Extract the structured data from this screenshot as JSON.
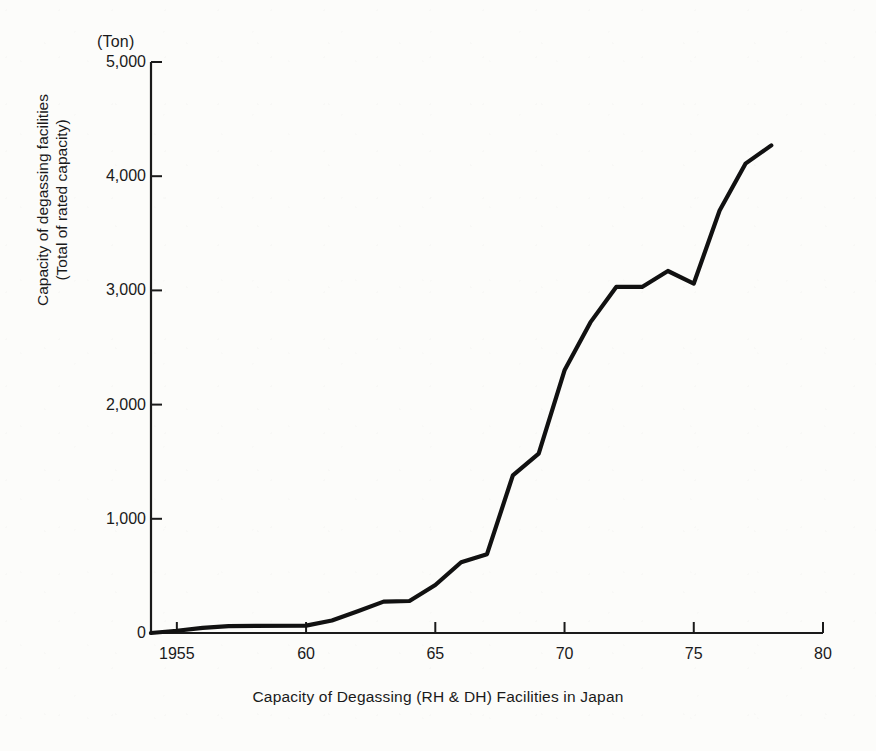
{
  "chart_data": {
    "type": "line",
    "title": "Capacity of Degassing (RH & DH) Facilities in Japan",
    "xlabel": "Capacity of Degassing (RH & DH) Facilities in Japan",
    "ylabel": "Capacity of degassing facilities\n(Total of rated capacity)",
    "ylabel_line1": "Capacity of degassing facilities",
    "ylabel_line2": "(Total of rated capacity)",
    "yunit": "(Ton)",
    "xlim": [
      1954,
      1980
    ],
    "ylim": [
      0,
      5000
    ],
    "grid": false,
    "legend": false,
    "xtick_labels": [
      "1955",
      "60",
      "65",
      "70",
      "75",
      "80"
    ],
    "xtick_values": [
      1955,
      1960,
      1965,
      1970,
      1975,
      1980
    ],
    "ytick_labels": [
      "0",
      "1,000",
      "2,000",
      "3,000",
      "4,000",
      "5,000"
    ],
    "ytick_values": [
      0,
      1000,
      2000,
      3000,
      4000,
      5000
    ],
    "series": [
      {
        "name": "Capacity of degassing facilities",
        "color": "#111111",
        "x": [
          1954,
          1955,
          1956,
          1957,
          1960,
          1961,
          1962,
          1963,
          1964,
          1965,
          1966,
          1967,
          1968,
          1969,
          1970,
          1971,
          1972,
          1973,
          1974,
          1975,
          1976,
          1977,
          1978
        ],
        "values": [
          0,
          20,
          45,
          60,
          65,
          110,
          190,
          275,
          280,
          420,
          620,
          690,
          1380,
          1570,
          2300,
          2720,
          3030,
          3030,
          3170,
          3060,
          3700,
          4110,
          4270
        ]
      }
    ]
  },
  "axes": {
    "y_unit_label": "(Ton)",
    "y_title_line1": "Capacity of degassing facilities",
    "y_title_line2": "(Total of rated capacity)",
    "x_title": "Capacity of Degassing (RH & DH) Facilities in Japan"
  }
}
